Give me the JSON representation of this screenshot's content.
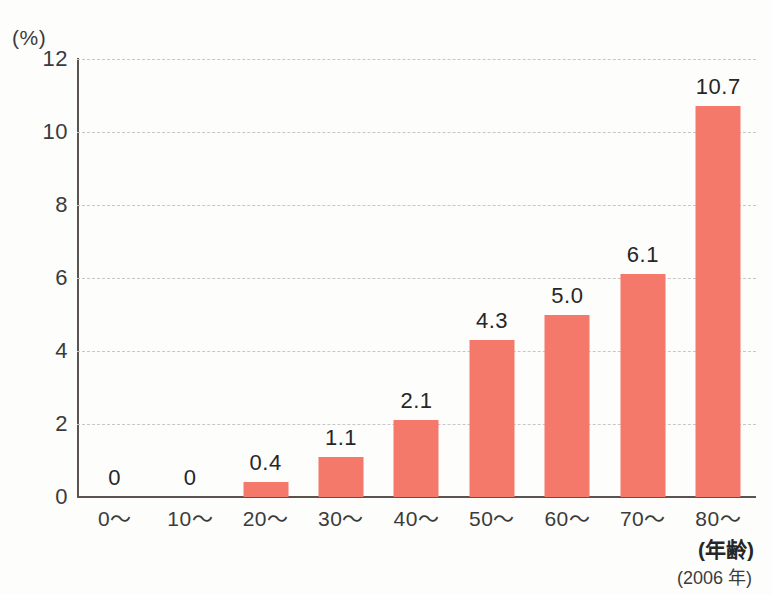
{
  "chart_data": {
    "type": "bar",
    "title": "",
    "subtitle": "",
    "xlabel": "(年齢)",
    "ylabel": "(%)",
    "categories": [
      "0〜",
      "10〜",
      "20〜",
      "30〜",
      "40〜",
      "50〜",
      "60〜",
      "70〜",
      "80〜"
    ],
    "values": [
      0,
      0,
      0.4,
      1.1,
      2.1,
      4.3,
      5.0,
      6.1,
      10.7
    ],
    "value_labels": [
      "0",
      "0",
      "0.4",
      "1.1",
      "2.1",
      "4.3",
      "5.0",
      "6.1",
      "10.7"
    ],
    "ylim": [
      0,
      12
    ],
    "yticks": [
      0,
      2,
      4,
      6,
      8,
      10,
      12
    ],
    "ytick_labels": [
      "0",
      "2",
      "4",
      "6",
      "8",
      "10",
      "12"
    ],
    "grid": true,
    "grid_style": "dashed-horizontal",
    "legend": "none",
    "bar_color": "#f5796a",
    "axis_color": "#5b5350",
    "grid_color": "#c9c6c6",
    "annotations": {
      "axis_note": "(年齢)",
      "year_note": "(2006 年)"
    }
  }
}
